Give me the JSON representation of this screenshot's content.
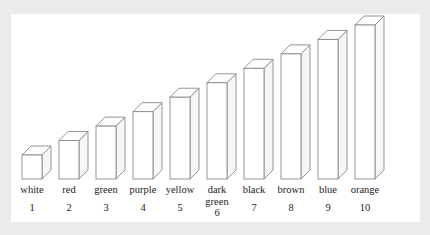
{
  "figure": {
    "panel_background": "#ffffff",
    "page_background": "#ebebeb",
    "outline_color": "#8a8a8a",
    "ghost_text": ""
  },
  "chart_data": {
    "type": "bar",
    "title": "",
    "subtitle": "",
    "xlabel": "",
    "ylabel": "",
    "grid": false,
    "legend": "none",
    "style": "3d-isometric-outline",
    "fill": "none (white / unfilled bars)",
    "categories": [
      "white",
      "red",
      "green",
      "purple",
      "yellow",
      "dark green",
      "black",
      "brown",
      "blue",
      "orange"
    ],
    "tick_labels": [
      "1",
      "2",
      "3",
      "4",
      "5",
      "6",
      "7",
      "8",
      "9",
      "10"
    ],
    "values": [
      1,
      2,
      3,
      4,
      5,
      6,
      7,
      8,
      9,
      10
    ],
    "ylim": [
      0,
      10
    ],
    "xlim": [
      0,
      11
    ],
    "annotations": [],
    "bars": [
      {
        "rank": 1,
        "name": "white",
        "value": 1,
        "number": "1"
      },
      {
        "rank": 2,
        "name": "red",
        "value": 2,
        "number": "2"
      },
      {
        "rank": 3,
        "name": "green",
        "value": 3,
        "number": "3"
      },
      {
        "rank": 4,
        "name": "purple",
        "value": 4,
        "number": "4"
      },
      {
        "rank": 5,
        "name": "yellow",
        "value": 5,
        "number": "5"
      },
      {
        "rank": 6,
        "name": "dark\ngreen",
        "value": 6,
        "number": "6"
      },
      {
        "rank": 7,
        "name": "black",
        "value": 7,
        "number": "7"
      },
      {
        "rank": 8,
        "name": "brown",
        "value": 8,
        "number": "8"
      },
      {
        "rank": 9,
        "name": "blue",
        "value": 9,
        "number": "9"
      },
      {
        "rank": 10,
        "name": "orange",
        "value": 10,
        "number": "10"
      }
    ]
  }
}
